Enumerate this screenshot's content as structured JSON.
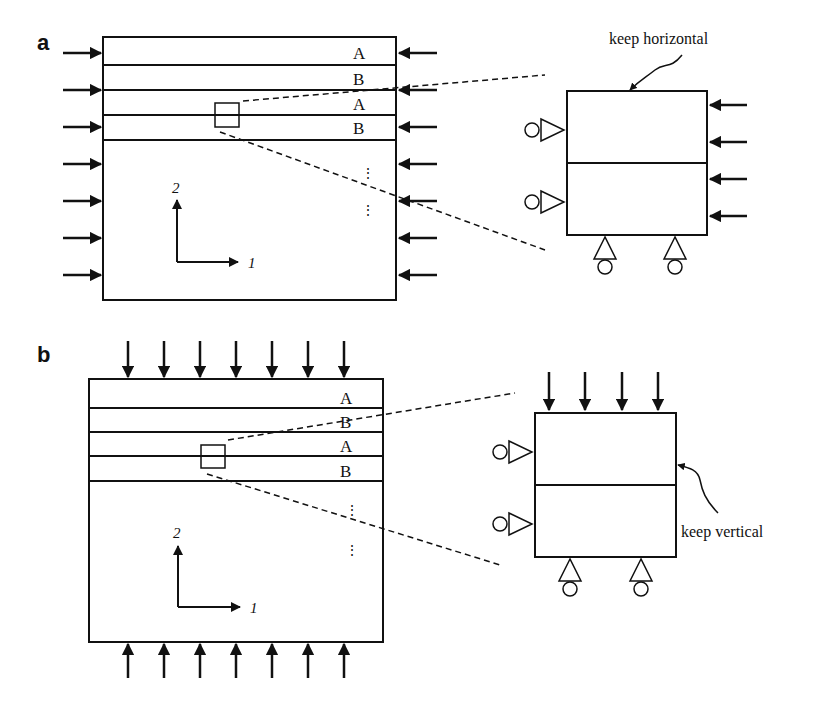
{
  "panels": [
    {
      "label": "a",
      "layers": [
        "A",
        "B",
        "A",
        "B"
      ],
      "axis_x": "1",
      "axis_y": "2",
      "annotation": "keep horizontal",
      "load": "horizontal compression (arrows on left and right edges)"
    },
    {
      "label": "b",
      "layers": [
        "A",
        "B",
        "A",
        "B"
      ],
      "axis_x": "1",
      "axis_y": "2",
      "annotation": "keep vertical",
      "load": "vertical compression (arrows on top and bottom edges)"
    }
  ],
  "colors": {
    "ink": "#111111",
    "background": "#ffffff"
  }
}
